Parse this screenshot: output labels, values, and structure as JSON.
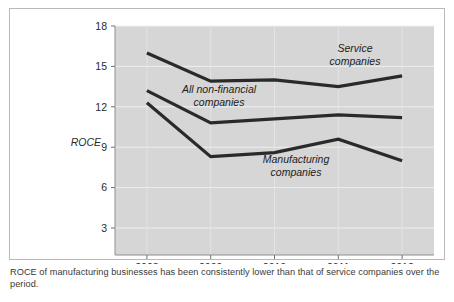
{
  "figure": {
    "y_axis_title": "ROCE",
    "caption": "ROCE of manufacturing businesses has been consistently lower than that of service companies over the period."
  },
  "chart_data": {
    "type": "line",
    "title": "",
    "xlabel": "",
    "ylabel": "ROCE",
    "categories": [
      "2008",
      "2009",
      "2010",
      "2011",
      "2012"
    ],
    "x_tick_labels": [
      "2008",
      "2009",
      "2010",
      "2011",
      "2012"
    ],
    "y_tick_labels": [
      "3",
      "6",
      "9",
      "12",
      "15",
      "18"
    ],
    "y_ticks": [
      3,
      6,
      9,
      12,
      15,
      18
    ],
    "ylim": [
      0,
      18
    ],
    "xlim": [
      2007.5,
      2012.5
    ],
    "grid": true,
    "legend_position": "inline-annotations",
    "plot_background": "#d6d6d6",
    "line_color": "#2a2a2a",
    "series": [
      {
        "name": "Service companies",
        "label": "Service",
        "label_line2": "companies",
        "values": [
          16.0,
          13.9,
          14.0,
          13.5,
          14.3
        ]
      },
      {
        "name": "All non-financial companies",
        "label": "All non-financial",
        "label_line2": "companies",
        "values": [
          13.2,
          10.8,
          11.1,
          11.4,
          11.2
        ]
      },
      {
        "name": "Manufacturing companies",
        "label": "Manufacturing",
        "label_line2": "companies",
        "values": [
          12.3,
          8.3,
          8.6,
          9.6,
          8.0
        ]
      }
    ]
  }
}
